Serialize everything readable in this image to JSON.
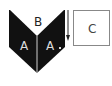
{
  "diagram": {
    "labels": {
      "top_triangle": "B",
      "left_panel": "A",
      "right_panel": "A",
      "box": "C"
    },
    "colors": {
      "fill_dark": "#111111",
      "fill_light": "#ffffff",
      "box_border": "#888888",
      "arrow": "#222222"
    },
    "arrow_direction": "down"
  }
}
